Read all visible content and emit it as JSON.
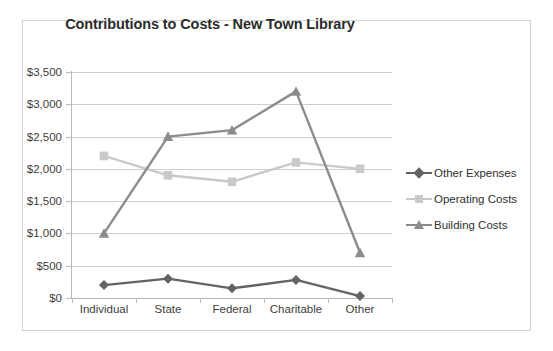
{
  "chart_data": {
    "type": "line",
    "title": "Contributions to Costs - New Town Library",
    "xlabel": "",
    "ylabel": "",
    "ylim": [
      0,
      3500
    ],
    "ytick_step": 500,
    "grid": true,
    "legend_position": "right",
    "categories": [
      "Individual",
      "State",
      "Federal",
      "Charitable",
      "Other"
    ],
    "ytick_labels": [
      "$0",
      "$500",
      "$1,000",
      "$1,500",
      "$2,000",
      "$2,500",
      "$3,000",
      "$3,500"
    ],
    "ytick_values": [
      0,
      500,
      1000,
      1500,
      2000,
      2500,
      3000,
      3500
    ],
    "series": [
      {
        "name": "Other Expenses",
        "marker": "diamond",
        "color": "#636363",
        "values": [
          200,
          300,
          150,
          280,
          30
        ]
      },
      {
        "name": "Operating Costs",
        "marker": "square",
        "color": "#c9c9c9",
        "values": [
          2200,
          1900,
          1800,
          2100,
          2000
        ]
      },
      {
        "name": "Building Costs",
        "marker": "triangle",
        "color": "#8c8c8c",
        "values": [
          1000,
          2500,
          2600,
          3200,
          700
        ]
      }
    ]
  },
  "colors": {
    "title_text": "#2b2b2b",
    "axis_text": "#3d3d3d",
    "gridline": "#cfcfcf",
    "axis_line": "#b8b8b8",
    "frame_border": "#d2d2d2",
    "background": "#ffffff"
  }
}
